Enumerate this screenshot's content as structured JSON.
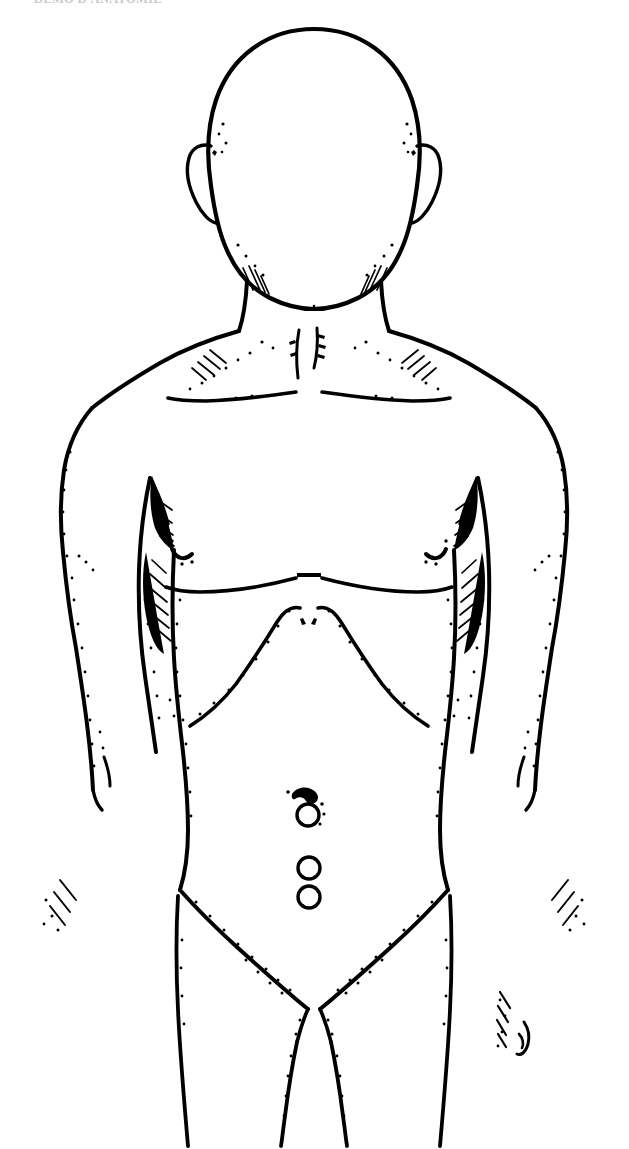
{
  "document": {
    "running_header": "DEMO D'ANATOMIE",
    "figure_kind": "anatomical-line-drawing",
    "view": "anterior",
    "subject": "male torso"
  },
  "figure": {
    "title": "Anterior male torso line drawing",
    "background_color": "#ffffff",
    "ink_color": "#000000",
    "regions": [
      {
        "name": "head",
        "label": "Head"
      },
      {
        "name": "neck",
        "label": "Neck"
      },
      {
        "name": "left-shoulder",
        "label": "Left shoulder"
      },
      {
        "name": "right-shoulder",
        "label": "Right shoulder"
      },
      {
        "name": "chest",
        "label": "Chest"
      },
      {
        "name": "left-arm",
        "label": "Left arm"
      },
      {
        "name": "right-arm",
        "label": "Right arm"
      },
      {
        "name": "abdomen",
        "label": "Abdomen"
      },
      {
        "name": "pelvis",
        "label": "Pelvis"
      },
      {
        "name": "left-thigh",
        "label": "Left thigh"
      },
      {
        "name": "right-thigh",
        "label": "Right thigh"
      }
    ]
  },
  "markers": {
    "count": 3,
    "shape": "circle",
    "color": "#000000",
    "items": [
      {
        "id": "marker-1",
        "label": "1",
        "cx": 308,
        "cy": 815,
        "r": 11
      },
      {
        "id": "marker-2",
        "label": "2",
        "cx": 309,
        "cy": 868,
        "r": 11
      },
      {
        "id": "marker-3",
        "label": "3",
        "cx": 309,
        "cy": 897,
        "r": 11
      }
    ]
  },
  "landmarks": {
    "umbilicus": {
      "label": "Umbilicus",
      "cx": 304,
      "cy": 800
    },
    "left_nipple": {
      "label": "Left nipple",
      "cx": 182,
      "cy": 553
    },
    "right_nipple": {
      "label": "Right nipple",
      "cx": 436,
      "cy": 553
    },
    "suprasternal_notch": {
      "label": "Suprasternal notch",
      "cx": 305,
      "cy": 330
    },
    "xiphoid": {
      "label": "Xiphoid process",
      "cx": 305,
      "cy": 610
    }
  }
}
